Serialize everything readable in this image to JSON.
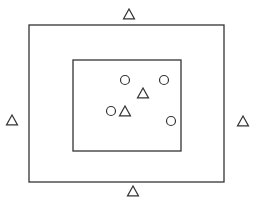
{
  "diagram": {
    "colors": {
      "background": "#ffffff",
      "stroke": "#333333"
    },
    "outer_rect": {
      "x": 29,
      "y": 25,
      "width": 195,
      "height": 157
    },
    "inner_rect": {
      "x": 73,
      "y": 60,
      "width": 108,
      "height": 91
    },
    "triangle_size": 11,
    "circle_radius": 4.5,
    "outer_triangles": [
      {
        "position": "top",
        "cx": 129,
        "cy": 14
      },
      {
        "position": "bottom",
        "cx": 133,
        "cy": 191
      },
      {
        "position": "left",
        "cx": 12,
        "cy": 120
      },
      {
        "position": "right",
        "cx": 243,
        "cy": 121
      }
    ],
    "inner_triangles": [
      {
        "cx": 143,
        "cy": 93
      },
      {
        "cx": 125,
        "cy": 111
      }
    ],
    "inner_circles": [
      {
        "cx": 125,
        "cy": 80
      },
      {
        "cx": 164,
        "cy": 80
      },
      {
        "cx": 111,
        "cy": 111
      },
      {
        "cx": 171,
        "cy": 121
      }
    ]
  }
}
